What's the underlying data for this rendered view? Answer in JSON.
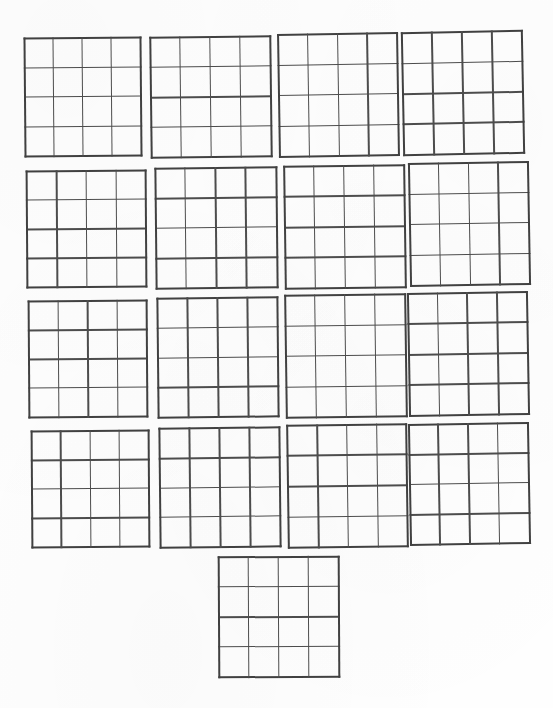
{
  "page": {
    "width": 553,
    "height": 708,
    "background_color": "#fefefe",
    "line_color": "#4d4d4d",
    "edge_line_color": "#414141",
    "grid_rows": 4,
    "grid_columns": 4,
    "cells_per_grid": 16,
    "total_grids": 17,
    "layout_note": "Four rows of four grids with a single centered grid beneath"
  },
  "grids": [
    {
      "id": "grid-r1-c1",
      "row": 1,
      "col": 1,
      "x": 24,
      "y": 37,
      "w": 118,
      "h": 120,
      "rotate": -0.5,
      "cols": 4,
      "rows": 4,
      "content": ""
    },
    {
      "id": "grid-r1-c2",
      "row": 1,
      "col": 2,
      "x": 150,
      "y": 36,
      "w": 122,
      "h": 122,
      "rotate": -0.7,
      "cols": 4,
      "rows": 4,
      "content": ""
    },
    {
      "id": "grid-r1-c3",
      "row": 1,
      "col": 3,
      "x": 278,
      "y": 33,
      "w": 121,
      "h": 124,
      "rotate": -0.9,
      "cols": 4,
      "rows": 4,
      "content": ""
    },
    {
      "id": "grid-r1-c4",
      "row": 1,
      "col": 4,
      "x": 402,
      "y": 31,
      "w": 122,
      "h": 124,
      "rotate": -1.1,
      "cols": 4,
      "rows": 4,
      "content": ""
    },
    {
      "id": "grid-r2-c1",
      "row": 2,
      "col": 1,
      "x": 26,
      "y": 170,
      "w": 121,
      "h": 118,
      "rotate": -0.4,
      "cols": 4,
      "rows": 4,
      "content": ""
    },
    {
      "id": "grid-r2-c2",
      "row": 2,
      "col": 2,
      "x": 155,
      "y": 167,
      "w": 123,
      "h": 122,
      "rotate": -0.6,
      "cols": 4,
      "rows": 4,
      "content": ""
    },
    {
      "id": "grid-r2-c3",
      "row": 2,
      "col": 3,
      "x": 284,
      "y": 165,
      "w": 122,
      "h": 124,
      "rotate": -0.8,
      "cols": 4,
      "rows": 4,
      "content": ""
    },
    {
      "id": "grid-r2-c4",
      "row": 2,
      "col": 4,
      "x": 409,
      "y": 162,
      "w": 121,
      "h": 124,
      "rotate": -1.0,
      "cols": 4,
      "rows": 4,
      "content": ""
    },
    {
      "id": "grid-r3-c1",
      "row": 3,
      "col": 1,
      "x": 28,
      "y": 300,
      "w": 120,
      "h": 118,
      "rotate": -0.4,
      "cols": 4,
      "rows": 4,
      "content": ""
    },
    {
      "id": "grid-r3-c2",
      "row": 3,
      "col": 2,
      "x": 157,
      "y": 297,
      "w": 122,
      "h": 121,
      "rotate": -0.6,
      "cols": 4,
      "rows": 4,
      "content": ""
    },
    {
      "id": "grid-r3-c3",
      "row": 3,
      "col": 3,
      "x": 285,
      "y": 294,
      "w": 122,
      "h": 124,
      "rotate": -0.8,
      "cols": 4,
      "rows": 4,
      "content": ""
    },
    {
      "id": "grid-r3-c4",
      "row": 3,
      "col": 4,
      "x": 408,
      "y": 292,
      "w": 121,
      "h": 124,
      "rotate": -1.0,
      "cols": 4,
      "rows": 4,
      "content": ""
    },
    {
      "id": "grid-r4-c1",
      "row": 4,
      "col": 1,
      "x": 31,
      "y": 430,
      "w": 119,
      "h": 118,
      "rotate": -0.4,
      "cols": 4,
      "rows": 4,
      "content": ""
    },
    {
      "id": "grid-r4-c2",
      "row": 4,
      "col": 2,
      "x": 159,
      "y": 427,
      "w": 122,
      "h": 121,
      "rotate": -0.6,
      "cols": 4,
      "rows": 4,
      "content": ""
    },
    {
      "id": "grid-r4-c3",
      "row": 4,
      "col": 3,
      "x": 287,
      "y": 424,
      "w": 121,
      "h": 124,
      "rotate": -0.8,
      "cols": 4,
      "rows": 4,
      "content": ""
    },
    {
      "id": "grid-r4-c4",
      "row": 4,
      "col": 4,
      "x": 409,
      "y": 423,
      "w": 121,
      "h": 122,
      "rotate": -1.0,
      "cols": 4,
      "rows": 4,
      "content": ""
    },
    {
      "id": "grid-r5-c1",
      "row": 5,
      "col": 1,
      "x": 218,
      "y": 556,
      "w": 122,
      "h": 122,
      "rotate": -0.3,
      "cols": 4,
      "rows": 4,
      "content": ""
    }
  ]
}
